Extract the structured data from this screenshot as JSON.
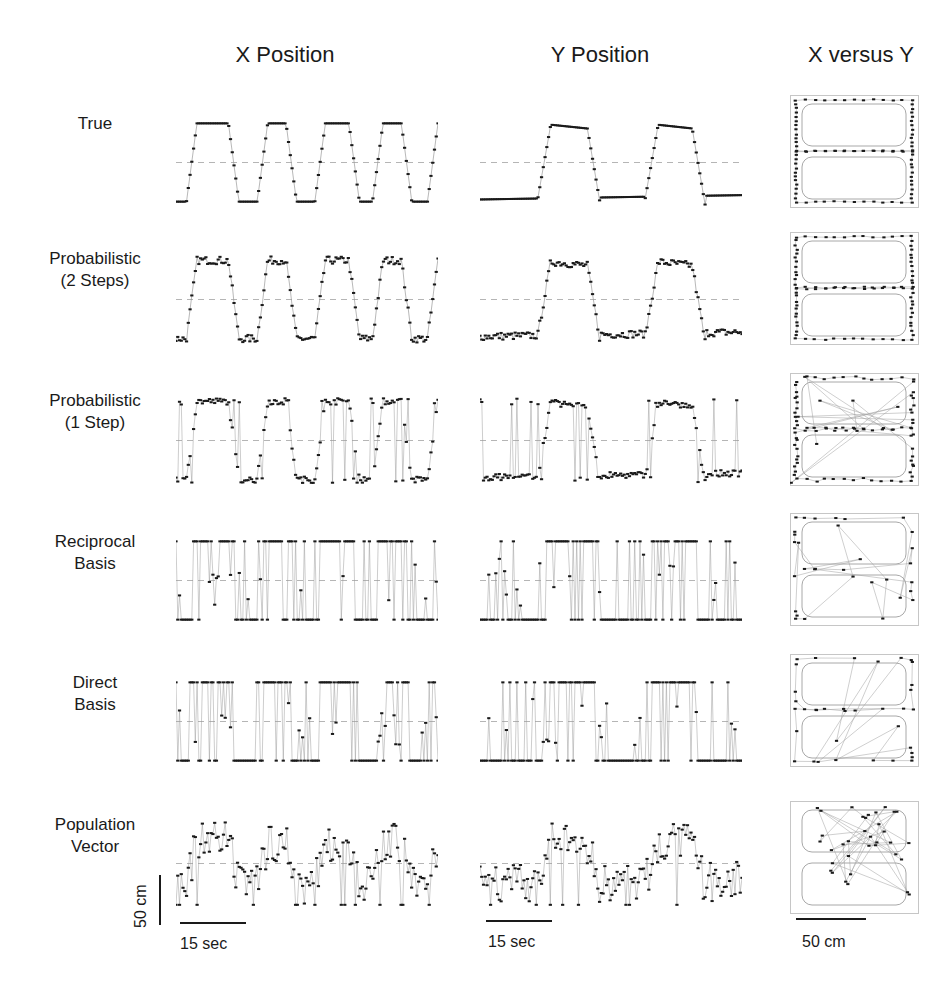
{
  "chart_data": {
    "type": "scatter",
    "title": "",
    "columns": [
      "X Position",
      "Y Position",
      "X versus Y"
    ],
    "rows": [
      {
        "label": "True",
        "label_lines": [
          "True"
        ]
      },
      {
        "label": "Probabilistic (2 Steps)",
        "label_lines": [
          "Probabilistic",
          "(2 Steps)"
        ]
      },
      {
        "label": "Probabilistic (1 Step)",
        "label_lines": [
          "Probabilistic",
          "(1 Step)"
        ]
      },
      {
        "label": "Reciprocal Basis",
        "label_lines": [
          "Reciprocal",
          "Basis"
        ]
      },
      {
        "label": "Direct Basis",
        "label_lines": [
          "Direct",
          "Basis"
        ]
      },
      {
        "label": "Population Vector",
        "label_lines": [
          "Population",
          "Vector"
        ]
      }
    ],
    "scale_bars": {
      "time": "15 sec",
      "position_vertical": "50 cm",
      "position_xy": "50 cm"
    },
    "series_shape": {
      "true_x": "square wave, ~4.5 cycles, high plateau ~ +45 cm, low ~ -45 cm around dashed midline",
      "true_y": "two broad humps; baseline low ~ -40 cm, peaks ~ +40 cm, brief steps at midline",
      "xy": "rectangular figure-8 track with central crossbar"
    },
    "legend": [],
    "grid": false,
    "midline": "dashed horizontal reference at center of each time series"
  },
  "headers": {
    "x_position": "X Position",
    "y_position": "Y Position",
    "x_versus_y": "X versus Y"
  },
  "rows": {
    "r0": {
      "l1": "True",
      "l2": ""
    },
    "r1": {
      "l1": "Probabilistic",
      "l2": "(2 Steps)"
    },
    "r2": {
      "l1": "Probabilistic",
      "l2": "(1 Step)"
    },
    "r3": {
      "l1": "Reciprocal",
      "l2": "Basis"
    },
    "r4": {
      "l1": "Direct",
      "l2": "Basis"
    },
    "r5": {
      "l1": "Population",
      "l2": "Vector"
    }
  },
  "scales": {
    "x_time": "15 sec",
    "y_time": "15 sec",
    "vertical": "50 cm",
    "xy": "50 cm"
  },
  "colors": {
    "ink": "#1a1a1a",
    "trace": "#9a9a9a",
    "midline": "#b5b5b5",
    "track": "#a8a8a8"
  }
}
